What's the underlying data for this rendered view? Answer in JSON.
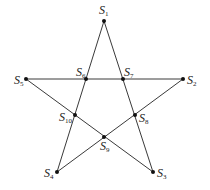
{
  "diagram": {
    "type": "pentagram",
    "stroke_color": "#3a3a3a",
    "point_color": "#111111",
    "points": [
      {
        "id": "S1",
        "base": "S",
        "sub": "1",
        "x": 104,
        "y": 21,
        "lx": 99,
        "ly": 14
      },
      {
        "id": "S2",
        "base": "S",
        "sub": "2",
        "x": 183,
        "y": 79,
        "lx": 187,
        "ly": 84
      },
      {
        "id": "S3",
        "base": "S",
        "sub": "3",
        "x": 153,
        "y": 172,
        "lx": 157,
        "ly": 177
      },
      {
        "id": "S4",
        "base": "S",
        "sub": "4",
        "x": 57,
        "y": 172,
        "lx": 44,
        "ly": 177
      },
      {
        "id": "S5",
        "base": "S",
        "sub": "5",
        "x": 26,
        "y": 79,
        "lx": 14,
        "ly": 84
      },
      {
        "id": "S6",
        "base": "S",
        "sub": "6",
        "x": 86,
        "y": 79,
        "lx": 76,
        "ly": 76
      },
      {
        "id": "S7",
        "base": "S",
        "sub": "7",
        "x": 123,
        "y": 79,
        "lx": 124,
        "ly": 76
      },
      {
        "id": "S8",
        "base": "S",
        "sub": "8",
        "x": 135,
        "y": 115,
        "lx": 139,
        "ly": 122
      },
      {
        "id": "S9",
        "base": "S",
        "sub": "9",
        "x": 104,
        "y": 137,
        "lx": 100,
        "ly": 150
      },
      {
        "id": "S10",
        "base": "S",
        "sub": "10",
        "x": 75,
        "y": 115,
        "lx": 59,
        "ly": 121
      }
    ],
    "edges": [
      [
        "S1",
        "S4"
      ],
      [
        "S1",
        "S3"
      ],
      [
        "S5",
        "S2"
      ],
      [
        "S5",
        "S3"
      ],
      [
        "S2",
        "S4"
      ]
    ]
  }
}
